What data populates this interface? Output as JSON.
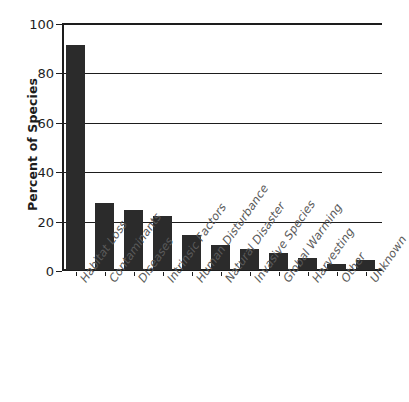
{
  "chart_data": {
    "type": "bar",
    "title": "",
    "subtitle": "",
    "xlabel": "",
    "ylabel": "Percent of Species",
    "ylim": [
      0,
      100
    ],
    "yticks": [
      0,
      20,
      40,
      60,
      80,
      100
    ],
    "grid": true,
    "legend": false,
    "orientation": "vertical",
    "bar_color": "#2b2b2b",
    "categories": [
      "Habitat Loss",
      "Contaminants",
      "Diseases",
      "Intrinsic Factors",
      "Human Disturbance",
      "Natural Disaster",
      "Invasive Species",
      "Global Warming",
      "Harvesting",
      "Other",
      "Unknown"
    ],
    "values": [
      91,
      27,
      24.5,
      22,
      14,
      10,
      8.5,
      7,
      5,
      2.5,
      4
    ]
  },
  "axis": {
    "y_title": "Percent of Species",
    "y_tick_labels": [
      "100",
      "80",
      "60",
      "40",
      "20",
      "0"
    ]
  },
  "colors": {
    "bar": "#2b2b2b",
    "axis": "#1d1d1d",
    "category_label": "#5a5a5a",
    "background": "#ffffff"
  }
}
